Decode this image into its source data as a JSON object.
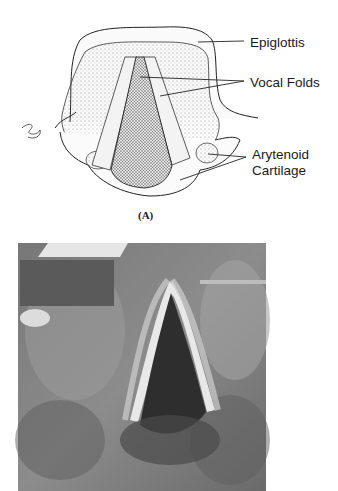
{
  "diagram": {
    "panel_a": {
      "caption": "(A)",
      "labels": {
        "epiglottis": "Epiglottis",
        "vocal_folds": "Vocal Folds",
        "arytenoid_line1": "Arytenoid",
        "arytenoid_line2": "Cartilage"
      }
    },
    "panel_b": {
      "description": "grayscale laryngoscopic photograph of vocal folds"
    }
  }
}
